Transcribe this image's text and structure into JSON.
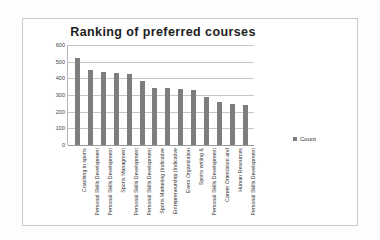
{
  "chart_data": {
    "type": "bar",
    "title": "Ranking of preferred courses",
    "xlabel": "",
    "ylabel": "",
    "ylim": [
      0,
      600
    ],
    "yticks": [
      600,
      500,
      400,
      300,
      200,
      100,
      0
    ],
    "grid": true,
    "legend": {
      "position": "right",
      "entries": [
        "Count"
      ]
    },
    "series_name": "Count",
    "bar_color": "#7d7d7d",
    "categories": [
      "Coaching in sports",
      "Personal Skills Development",
      "Personal Skills Development",
      "Sports Managment",
      "Personal Skills Development",
      "Personal Skills Development",
      "Sports Marketing (Indicative",
      "Entrepreneurship (Indicative",
      "Event Organization",
      "Sports writing &",
      "Personal Skills Development",
      "Career Orientation and",
      "Human Resources",
      "Personal Skills Development"
    ],
    "values": [
      525,
      450,
      440,
      435,
      428,
      385,
      345,
      340,
      338,
      328,
      288,
      258,
      247,
      240
    ]
  }
}
